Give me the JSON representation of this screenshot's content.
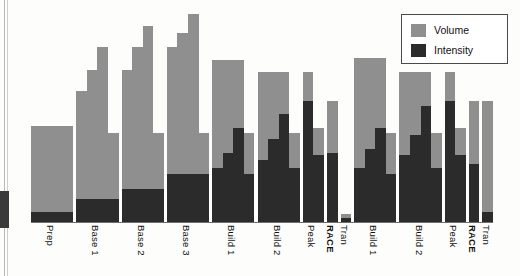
{
  "chart_data": {
    "type": "bar",
    "title": "",
    "subtitle": "",
    "xlabel": "",
    "ylabel": "",
    "ylim": [
      0,
      100
    ],
    "grid": false,
    "stacked": true,
    "legend_position": "top-right",
    "legend": [
      {
        "label": "Volume",
        "color": "#8f8f8f"
      },
      {
        "label": "Intensity",
        "color": "#2b2b2b"
      }
    ],
    "categories": [
      "Prep",
      "Base 1",
      "Base 2",
      "Base 3",
      "Build 1",
      "Build 2",
      "Peak",
      "RACE",
      "Tran",
      "Build 1",
      "Build 2",
      "Peak",
      "RACE",
      "Tran"
    ],
    "category_emphasis": [
      false,
      false,
      false,
      false,
      false,
      false,
      false,
      true,
      false,
      false,
      false,
      false,
      true,
      false
    ],
    "note": "Each training-phase block is subdivided into weekly microcycles. Values are percent of plot height; volume is the full bar, intensity is the dark portion measured from the baseline.",
    "blocks": [
      {
        "category": "Prep",
        "weeks": [
          {
            "volume": 46,
            "intensity": 5
          },
          {
            "volume": 46,
            "intensity": 5
          },
          {
            "volume": 46,
            "intensity": 5
          },
          {
            "volume": 46,
            "intensity": 5
          }
        ]
      },
      {
        "category": "Base 1",
        "weeks": [
          {
            "volume": 63,
            "intensity": 11
          },
          {
            "volume": 73,
            "intensity": 11
          },
          {
            "volume": 84,
            "intensity": 11
          },
          {
            "volume": 43,
            "intensity": 11
          }
        ]
      },
      {
        "category": "Base 2",
        "weeks": [
          {
            "volume": 73,
            "intensity": 16
          },
          {
            "volume": 84,
            "intensity": 16
          },
          {
            "volume": 94,
            "intensity": 16
          },
          {
            "volume": 43,
            "intensity": 16
          }
        ]
      },
      {
        "category": "Base 3",
        "weeks": [
          {
            "volume": 84,
            "intensity": 23
          },
          {
            "volume": 91,
            "intensity": 23
          },
          {
            "volume": 100,
            "intensity": 23
          },
          {
            "volume": 43,
            "intensity": 23
          }
        ]
      },
      {
        "category": "Build 1",
        "weeks": [
          {
            "volume": 78,
            "intensity": 26
          },
          {
            "volume": 78,
            "intensity": 33
          },
          {
            "volume": 78,
            "intensity": 45
          },
          {
            "volume": 43,
            "intensity": 23
          }
        ]
      },
      {
        "category": "Build 2",
        "weeks": [
          {
            "volume": 72,
            "intensity": 30
          },
          {
            "volume": 72,
            "intensity": 40
          },
          {
            "volume": 72,
            "intensity": 52
          },
          {
            "volume": 43,
            "intensity": 26
          }
        ]
      },
      {
        "category": "Peak",
        "weeks": [
          {
            "volume": 72,
            "intensity": 58
          },
          {
            "volume": 45,
            "intensity": 32
          }
        ]
      },
      {
        "category": "RACE",
        "weeks": [
          {
            "volume": 58,
            "intensity": 33
          }
        ]
      },
      {
        "category": "Tran",
        "weeks": [
          {
            "volume": 4,
            "intensity": 2
          }
        ]
      },
      {
        "category": "Build 1",
        "weeks": [
          {
            "volume": 79,
            "intensity": 26
          },
          {
            "volume": 79,
            "intensity": 35
          },
          {
            "volume": 79,
            "intensity": 45
          },
          {
            "volume": 43,
            "intensity": 23
          }
        ]
      },
      {
        "category": "Build 2",
        "weeks": [
          {
            "volume": 72,
            "intensity": 32
          },
          {
            "volume": 72,
            "intensity": 42
          },
          {
            "volume": 72,
            "intensity": 56
          },
          {
            "volume": 43,
            "intensity": 26
          }
        ]
      },
      {
        "category": "Peak",
        "weeks": [
          {
            "volume": 72,
            "intensity": 58
          },
          {
            "volume": 45,
            "intensity": 32
          }
        ]
      },
      {
        "category": "RACE",
        "weeks": [
          {
            "volume": 58,
            "intensity": 28
          }
        ]
      },
      {
        "category": "Tran",
        "weeks": [
          {
            "volume": 58,
            "intensity": 5
          }
        ]
      }
    ],
    "colors": {
      "volume": "#8f8f8f",
      "intensity": "#2b2b2b",
      "baseline": "#6f6f6f",
      "background": "#fdfdfb",
      "legend_border": "#4a4a4a"
    }
  }
}
